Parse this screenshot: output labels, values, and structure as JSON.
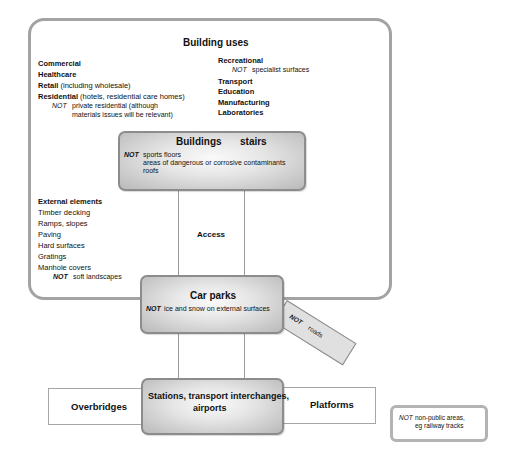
{
  "building_uses": {
    "title": "Building uses",
    "left": [
      {
        "label": "Commercial",
        "detail": ""
      },
      {
        "label": "Healthcare",
        "detail": ""
      },
      {
        "label": "Retail",
        "detail": " (including wholesale)"
      },
      {
        "label": "Residential",
        "detail": " (hotels, residential care homes)"
      }
    ],
    "left_not": {
      "not": "NOT",
      "line1": "private residential (although",
      "line2": "materials issues will be relevant)"
    },
    "right": [
      {
        "label": "Recreational"
      },
      {
        "label": "Transport"
      },
      {
        "label": "Education"
      },
      {
        "label": "Manufacturing"
      },
      {
        "label": "Laboratories"
      }
    ],
    "right_not": {
      "not": "NOT",
      "text": "specialist surfaces"
    }
  },
  "buildings_box": {
    "title_a": "Buildings",
    "title_b": "stairs",
    "not": "NOT",
    "items": [
      "sports floors",
      "areas of dangerous or corrosive contaminants",
      "roofs"
    ]
  },
  "external_elements": {
    "title": "External elements",
    "items": [
      "Timber decking",
      "Ramps, slopes",
      "Paving",
      "Hard surfaces",
      "Gratings",
      "Manhole covers"
    ],
    "not": "NOT",
    "not_text": "soft landscapes"
  },
  "access": {
    "label": "Access"
  },
  "car_parks": {
    "title": "Car parks",
    "not": "NOT",
    "text": "ice and snow on external surfaces"
  },
  "roads_box": {
    "not": "NOT",
    "text": "roads"
  },
  "stations": {
    "line1": "Stations, transport interchanges,",
    "line2": "airports"
  },
  "overbridges": {
    "label": "Overbridges"
  },
  "platforms": {
    "label": "Platforms"
  },
  "note": {
    "not": "NOT",
    "line1": "non-public areas,",
    "line2": "eg railway tracks"
  }
}
